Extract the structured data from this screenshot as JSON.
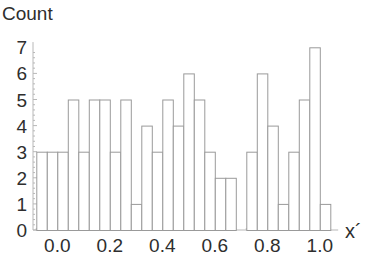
{
  "chart_data": {
    "type": "bar",
    "subtype": "histogram",
    "title": "",
    "xlabel": "x´",
    "ylabel": "Count",
    "bin_width": 0.04,
    "bin_start": -0.08,
    "bin_edges": [
      -0.08,
      -0.04,
      0.0,
      0.04,
      0.08,
      0.12,
      0.16,
      0.2,
      0.24,
      0.28,
      0.32,
      0.36,
      0.4,
      0.44,
      0.48,
      0.52,
      0.56,
      0.6,
      0.64,
      0.68,
      0.72,
      0.76,
      0.8,
      0.84,
      0.88,
      0.92,
      0.96,
      1.0,
      1.04
    ],
    "values": [
      3,
      3,
      3,
      5,
      3,
      5,
      5,
      3,
      5,
      1,
      4,
      3,
      5,
      4,
      6,
      5,
      3,
      2,
      2,
      0,
      3,
      6,
      4,
      1,
      3,
      5,
      7,
      1
    ],
    "xlim": [
      -0.09,
      1.07
    ],
    "ylim": [
      0,
      7.2
    ],
    "xticks": [
      "0.0",
      "0.2",
      "0.4",
      "0.6",
      "0.8",
      "1.0"
    ],
    "xtick_values": [
      0.0,
      0.2,
      0.4,
      0.6,
      0.8,
      1.0
    ],
    "yticks": [
      "0",
      "1",
      "2",
      "3",
      "4",
      "5",
      "6",
      "7"
    ],
    "ytick_values": [
      0,
      1,
      2,
      3,
      4,
      5,
      6,
      7
    ],
    "grid": false,
    "legend": null,
    "colors": {
      "bar_fill": "#ffffff",
      "bar_edge": "#9a9a9a",
      "axis": "#b8b8b8",
      "text": "#2e2e2e"
    }
  }
}
